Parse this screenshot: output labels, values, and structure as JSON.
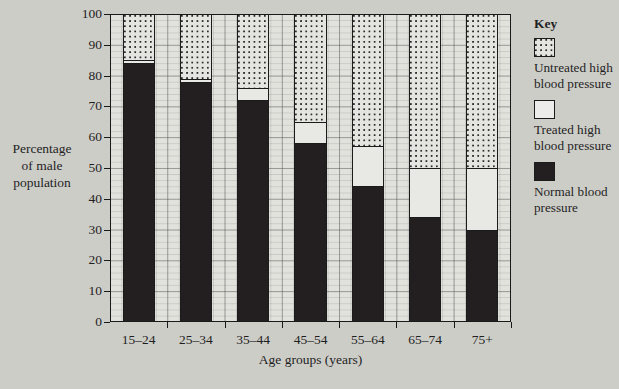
{
  "chart_data": {
    "type": "bar",
    "subtype": "stacked-bar-100",
    "title": "",
    "xlabel": "Age groups (years)",
    "ylabel": "Percentage of male population",
    "ylim": [
      0,
      100
    ],
    "ytick_step": 10,
    "yticks": [
      100,
      90,
      80,
      70,
      60,
      50,
      40,
      30,
      20,
      10,
      0
    ],
    "grid": true,
    "legend_position": "right",
    "categories": [
      "15–24",
      "25–34",
      "35–44",
      "45–54",
      "55–64",
      "65–74",
      "75+"
    ],
    "series": [
      {
        "name": "Normal blood pressure",
        "fill": "solid-black",
        "color": "#231f20",
        "values": [
          84,
          78,
          72,
          58,
          44,
          34,
          30
        ]
      },
      {
        "name": "Treated high blood pressure",
        "fill": "white",
        "color": "#e8e8e4",
        "values": [
          1,
          1,
          4,
          7,
          13,
          16,
          20
        ]
      },
      {
        "name": "Untreated high blood pressure",
        "fill": "dotted",
        "color": "#e4e4e0",
        "values": [
          15,
          21,
          24,
          35,
          43,
          50,
          50
        ]
      }
    ]
  },
  "y_axis": {
    "title_lines": [
      "Percentage",
      "of male",
      "population"
    ]
  },
  "x_axis": {
    "title": "Age groups (years)"
  },
  "legend": {
    "title": "Key",
    "items": [
      {
        "swatch": "dotted-swatch",
        "label": "Untreated high blood pressure"
      },
      {
        "swatch": "white-swatch",
        "label": "Treated high blood pressure"
      },
      {
        "swatch": "black-swatch",
        "label": "Normal blood pressure"
      }
    ]
  }
}
